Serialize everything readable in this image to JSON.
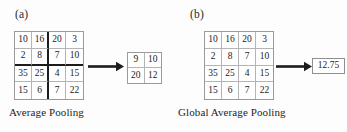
{
  "figure": {
    "background_color": "#fdfdfd",
    "grid_line_color": "#b4b4b4",
    "grid_border_color": "#9a9a9a",
    "accent_color": "#1c1c1c"
  },
  "panels": [
    {
      "label": "(a)",
      "caption": "Average  Pooling",
      "input_grid": {
        "rows": 4,
        "cols": 4,
        "values": [
          [
            10,
            16,
            20,
            3
          ],
          [
            2,
            8,
            7,
            10
          ],
          [
            35,
            25,
            4,
            15
          ],
          [
            15,
            6,
            7,
            22
          ]
        ],
        "flat": [
          10,
          16,
          20,
          3,
          2,
          8,
          7,
          10,
          35,
          25,
          4,
          15,
          15,
          6,
          7,
          22
        ],
        "window_separators": true
      },
      "arrow": "right-arrow",
      "output_grid": {
        "rows": 2,
        "cols": 2,
        "values": [
          [
            9,
            10
          ],
          [
            20,
            12
          ]
        ],
        "flat": [
          9,
          10,
          20,
          12
        ]
      }
    },
    {
      "label": "(b)",
      "caption": "Global Average Pooling",
      "input_grid": {
        "rows": 4,
        "cols": 4,
        "values": [
          [
            10,
            16,
            20,
            3
          ],
          [
            2,
            8,
            7,
            10
          ],
          [
            35,
            25,
            4,
            15
          ],
          [
            15,
            6,
            7,
            22
          ]
        ],
        "flat": [
          10,
          16,
          20,
          3,
          2,
          8,
          7,
          10,
          35,
          25,
          4,
          15,
          15,
          6,
          7,
          22
        ],
        "window_separators": false
      },
      "arrow": "right-arrow",
      "scalar_output": "12.75"
    }
  ]
}
